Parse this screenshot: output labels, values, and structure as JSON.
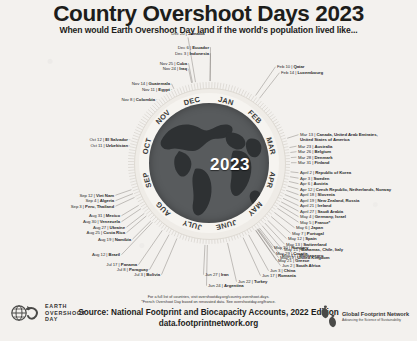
{
  "header": {
    "title": "Country Overshoot Days 2023",
    "subtitle": "When would Earth Overshoot Day land if the world's population lived like..."
  },
  "wheel": {
    "center_year": "2023",
    "months": [
      "JAN",
      "FEB",
      "MAR",
      "APR",
      "MAY",
      "JUNE",
      "JULY",
      "AUG",
      "SEP",
      "OCT",
      "NOV",
      "DEC"
    ]
  },
  "chart_data": {
    "type": "scatter",
    "title": "Country Overshoot Days 2023",
    "subtitle": "When would Earth Overshoot Day land if the world's population lived like...",
    "xlabel": "Date of Country Overshoot Day",
    "ylabel": "",
    "layout": "radial-year-dial",
    "axis_range": [
      "Jan 1",
      "Dec 31"
    ],
    "grid": false,
    "legend": "none",
    "annotations": [
      "For a full list of countries, visit overshootday.org/country-overshoot-days.",
      "*French Overshoot Day based on renovated data. See overshootday.org/france."
    ],
    "categories": [
      "Feb 10",
      "Feb 14",
      "Mar 13",
      "Mar 23",
      "Mar 26",
      "Mar 28",
      "Mar 31",
      "April 2",
      "Apr 3",
      "Apr 6",
      "Apr 12",
      "April 18",
      "April 19",
      "April 21",
      "April 27",
      "May 4",
      "May 5",
      "May 6",
      "May 7",
      "May 12",
      "May 13",
      "May 15",
      "May 17",
      "May 19",
      "May 21",
      "May 29",
      "May 30",
      "Jun 2",
      "Jun 3",
      "Jun 17",
      "Jun 22",
      "Jun 24",
      "Jun 27",
      "Jul 3",
      "Jul 8",
      "Jul 17",
      "Aug 12",
      "Aug 19",
      "Aug 25",
      "Aug 27",
      "Aug 30",
      "Aug 31",
      "Sep 3",
      "Sep 4",
      "Sep 12",
      "Oct 11",
      "Oct 12",
      "Nov 8",
      "Nov 11",
      "Nov 14",
      "Nov 24",
      "Nov 25",
      "Dec 3",
      "Dec 6",
      "Dec 20"
    ],
    "values": [
      "Qatar",
      "Luxembourg",
      "Canada, United Arab Emirates, United States of America",
      "Australia",
      "Belgium",
      "Denmark",
      "Finland",
      "Republic of Korea",
      "Sweden",
      "Austria",
      "Czech Republic, Netherlands, Norway",
      "Slovenia",
      "New Zealand, Russia",
      "Ireland",
      "Saudi Arabia",
      "Germany, Israel",
      "France*",
      "Japan",
      "Portugal",
      "Spain",
      "Switzerland",
      "Bahamas, Chile, Italy",
      "Montenegro",
      "United Kingdom",
      "Greece",
      "Croatia",
      "Hungary",
      "South Africa",
      "China",
      "Romania",
      "Turkey",
      "Argentina",
      "Iran",
      "Bolivia",
      "Paraguay",
      "Panama",
      "Brazil",
      "Namibia",
      "Costa Rica",
      "Ukraine",
      "Venezuela",
      "Mexico",
      "Peru, Thailand",
      "Algeria",
      "Viet Nam",
      "Uzbekistan",
      "El Salvador",
      "Colombia",
      "Egypt",
      "Guatemala",
      "Iraq",
      "Cuba",
      "Indonesia",
      "Ecuador",
      "Jamaica"
    ]
  },
  "labels_left": [
    {
      "date": "Dec 6",
      "country": "Ecuador"
    },
    {
      "date": "Dec 3",
      "country": "Indonesia"
    },
    {
      "date": "Nov 25",
      "country": "Cuba"
    },
    {
      "date": "Nov 24",
      "country": "Iraq"
    },
    {
      "date": "Nov 14",
      "country": "Guatemala"
    },
    {
      "date": "Nov 11",
      "country": "Egypt"
    },
    {
      "date": "Nov 8",
      "country": "Colombia"
    },
    {
      "date": "Oct 12",
      "country": "El Salvador"
    },
    {
      "date": "Oct 11",
      "country": "Uzbekistan"
    },
    {
      "date": "Sep 12",
      "country": "Viet Nam"
    },
    {
      "date": "Sep 4",
      "country": "Algeria"
    },
    {
      "date": "Sep 3",
      "country": "Peru, Thailand"
    },
    {
      "date": "Aug 31",
      "country": "Mexico"
    },
    {
      "date": "Aug 30",
      "country": "Venezuela"
    },
    {
      "date": "Aug 27",
      "country": "Ukraine"
    },
    {
      "date": "Aug 25",
      "country": "Costa Rica"
    },
    {
      "date": "Aug 19",
      "country": "Namibia"
    }
  ],
  "label_top": {
    "date": "Dec 20",
    "country": "Jamaica"
  },
  "labels_bottom": [
    {
      "date": "Aug 12",
      "country": "Brazil"
    },
    {
      "date": "Jul 17",
      "country": "Panama"
    },
    {
      "date": "Jul 8",
      "country": "Paraguay"
    },
    {
      "date": "Jul 3",
      "country": "Bolivia"
    },
    {
      "date": "Jun 27",
      "country": "Iran"
    },
    {
      "date": "Jun 24",
      "country": "Argentina"
    },
    {
      "date": "Jun 22",
      "country": "Turkey"
    },
    {
      "date": "Jun 17",
      "country": "Romania"
    },
    {
      "date": "Jun 3",
      "country": "China"
    },
    {
      "date": "Jun 2",
      "country": "South Africa"
    }
  ],
  "labels_right": [
    {
      "date": "Feb 10",
      "country": "Qatar"
    },
    {
      "date": "Feb 14",
      "country": "Luxembourg"
    },
    {
      "date": "Mar 13",
      "country": "Canada, United Arab Emirates,",
      "country2": "United States of America"
    },
    {
      "date": "Mar 23",
      "country": "Australia"
    },
    {
      "date": "Mar 26",
      "country": "Belgium"
    },
    {
      "date": "Mar 28",
      "country": "Denmark"
    },
    {
      "date": "Mar 31",
      "country": "Finland"
    },
    {
      "date": "April 2",
      "country": "Republic of Korea"
    },
    {
      "date": "Apr 3",
      "country": "Sweden"
    },
    {
      "date": "Apr 6",
      "country": "Austria"
    },
    {
      "date": "Apr 12",
      "country": "Czech Republic, Netherlands, Norway"
    },
    {
      "date": "April 18",
      "country": "Slovenia"
    },
    {
      "date": "April 19",
      "country": "New Zealand, Russia"
    },
    {
      "date": "April 21",
      "country": "Ireland"
    },
    {
      "date": "April 27",
      "country": "Saudi Arabia"
    },
    {
      "date": "May 4",
      "country": "Germany, Israel"
    },
    {
      "date": "May 5",
      "country": "France*"
    },
    {
      "date": "May 6",
      "country": "Japan"
    },
    {
      "date": "May 7",
      "country": "Portugal"
    },
    {
      "date": "May 12",
      "country": "Spain"
    },
    {
      "date": "May 13",
      "country": "Switzerland"
    },
    {
      "date": "May 15",
      "country": "Bahamas, Chile, Italy"
    },
    {
      "date": "May 17",
      "country": "Montenegro"
    },
    {
      "date": "May 19",
      "country": "United Kingdom"
    },
    {
      "date": "May 21",
      "country": "Greece"
    },
    {
      "date": "May 29",
      "country": "Croatia"
    },
    {
      "date": "May 30",
      "country": "Hungary"
    }
  ],
  "footer": {
    "fineprint_line1": "For a full list of countries, visit overshootday.org/country-overshoot-days.",
    "fineprint_line2": "*French Overshoot Day based on renovated data. See overshootday.org/france.",
    "source": "Source: National Footprint and Biocapacity Accounts, 2022 Edition",
    "source_url": "data.footprintnetwork.org"
  },
  "logos": {
    "eod_line1": "EARTH",
    "eod_line2": "OVERSHOOT",
    "eod_line3": "DAY",
    "gfn_name": "Global Footprint Network",
    "gfn_tagline": "Advancing the Science of Sustainability"
  }
}
